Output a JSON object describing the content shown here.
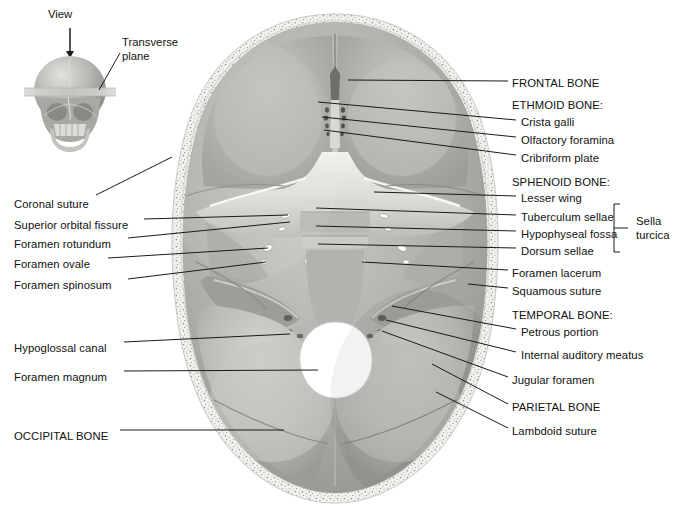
{
  "figure": {
    "background_color": "#ffffff",
    "text_color": "#111111",
    "leader_color": "#1a1a1a",
    "width": 676,
    "height": 518
  },
  "inset": {
    "name": "orientation-inset",
    "view_label": "View",
    "plane_label": "Transverse\nplane",
    "description": "anterior view of skull with horizontal transverse plane band and downward view arrow"
  },
  "labels_right": [
    {
      "id": "frontal-bone",
      "text": "FRONTAL BONE",
      "kind": "bone",
      "x": 512,
      "y": 77,
      "leader": {
        "x1": 508,
        "y1": 81,
        "x2": 348,
        "y2": 80
      }
    },
    {
      "id": "ethmoid-bone",
      "text": "ETHMOID BONE:",
      "kind": "heading",
      "x": 512,
      "y": 99,
      "leader": null
    },
    {
      "id": "crista-galli",
      "text": "Crista galli",
      "kind": "part",
      "x": 521,
      "y": 116,
      "leader": {
        "x1": 516,
        "y1": 120,
        "x2": 318,
        "y2": 102
      }
    },
    {
      "id": "olfactory-foramina",
      "text": "Olfactory foramina",
      "kind": "part",
      "x": 521,
      "y": 134,
      "leader": {
        "x1": 516,
        "y1": 137,
        "x2": 322,
        "y2": 117
      }
    },
    {
      "id": "cribriform-plate",
      "text": "Cribriform plate",
      "kind": "part",
      "x": 521,
      "y": 152,
      "leader": {
        "x1": 516,
        "y1": 155,
        "x2": 324,
        "y2": 130
      }
    },
    {
      "id": "sphenoid-bone",
      "text": "SPHENOID BONE:",
      "kind": "heading",
      "x": 512,
      "y": 176,
      "leader": null
    },
    {
      "id": "lesser-wing",
      "text": "Lesser wing",
      "kind": "part",
      "x": 521,
      "y": 192,
      "leader": {
        "x1": 516,
        "y1": 196,
        "x2": 374,
        "y2": 192
      }
    },
    {
      "id": "tuberculum-sellae",
      "text": "Tuberculum sellae",
      "kind": "part",
      "x": 521,
      "y": 211,
      "leader": {
        "x1": 516,
        "y1": 215,
        "x2": 316,
        "y2": 208
      }
    },
    {
      "id": "hypophyseal-fossa",
      "text": "Hypophyseal fossa",
      "kind": "part",
      "x": 521,
      "y": 228,
      "leader": {
        "x1": 516,
        "y1": 231,
        "x2": 316,
        "y2": 226
      }
    },
    {
      "id": "dorsum-sellae",
      "text": "Dorsum sellae",
      "kind": "part",
      "x": 521,
      "y": 245,
      "leader": {
        "x1": 516,
        "y1": 248,
        "x2": 318,
        "y2": 244
      }
    },
    {
      "id": "foramen-lacerum",
      "text": "Foramen lacerum",
      "kind": "part",
      "x": 512,
      "y": 267,
      "leader": {
        "x1": 508,
        "y1": 270,
        "x2": 362,
        "y2": 262
      }
    },
    {
      "id": "squamous-suture",
      "text": "Squamous suture",
      "kind": "part",
      "x": 512,
      "y": 285,
      "leader": {
        "x1": 508,
        "y1": 288,
        "x2": 468,
        "y2": 284
      }
    },
    {
      "id": "temporal-bone",
      "text": "TEMPORAL BONE:",
      "kind": "heading",
      "x": 512,
      "y": 309,
      "leader": null
    },
    {
      "id": "petrous-portion",
      "text": "Petrous portion",
      "kind": "part",
      "x": 521,
      "y": 326,
      "leader": {
        "x1": 516,
        "y1": 329,
        "x2": 392,
        "y2": 306
      }
    },
    {
      "id": "internal-auditory-meatus",
      "text": "Internal auditory meatus",
      "kind": "part",
      "x": 521,
      "y": 349,
      "leader": {
        "x1": 516,
        "y1": 352,
        "x2": 386,
        "y2": 320
      }
    },
    {
      "id": "jugular-foramen",
      "text": "Jugular foramen",
      "kind": "part",
      "x": 512,
      "y": 374,
      "leader": {
        "x1": 508,
        "y1": 377,
        "x2": 382,
        "y2": 331
      }
    },
    {
      "id": "parietal-bone",
      "text": "PARIETAL BONE",
      "kind": "bone",
      "x": 512,
      "y": 401,
      "leader": {
        "x1": 508,
        "y1": 404,
        "x2": 432,
        "y2": 364
      }
    },
    {
      "id": "lambdoid-suture",
      "text": "Lambdoid suture",
      "kind": "part",
      "x": 512,
      "y": 425,
      "leader": {
        "x1": 508,
        "y1": 428,
        "x2": 436,
        "y2": 392
      }
    }
  ],
  "labels_left": [
    {
      "id": "coronal-suture",
      "text": "Coronal suture",
      "x": 14,
      "y": 198,
      "leader": {
        "x1": 96,
        "y1": 195,
        "x2": 172,
        "y2": 157
      }
    },
    {
      "id": "superior-orbital-fissure",
      "text": "Superior orbital fissure",
      "x": 14,
      "y": 219,
      "leader": {
        "x1": 144,
        "y1": 219,
        "x2": 288,
        "y2": 215
      }
    },
    {
      "id": "foramen-rotundum",
      "text": "Foramen rotundum",
      "x": 14,
      "y": 238,
      "leader": {
        "x1": 128,
        "y1": 238,
        "x2": 290,
        "y2": 222
      }
    },
    {
      "id": "foramen-ovale",
      "text": "Foramen ovale",
      "x": 14,
      "y": 258,
      "leader": {
        "x1": 108,
        "y1": 258,
        "x2": 268,
        "y2": 248
      }
    },
    {
      "id": "foramen-spinosum",
      "text": "Foramen spinosum",
      "x": 14,
      "y": 279,
      "leader": {
        "x1": 128,
        "y1": 279,
        "x2": 266,
        "y2": 262
      }
    },
    {
      "id": "hypoglossal-canal",
      "text": "Hypoglossal canal",
      "x": 14,
      "y": 342,
      "leader": {
        "x1": 124,
        "y1": 342,
        "x2": 290,
        "y2": 334
      }
    },
    {
      "id": "foramen-magnum",
      "text": "Foramen magnum",
      "x": 14,
      "y": 371,
      "leader": {
        "x1": 124,
        "y1": 371,
        "x2": 318,
        "y2": 370
      }
    },
    {
      "id": "occipital-bone",
      "text": "OCCIPITAL BONE",
      "x": 14,
      "y": 430,
      "leader": {
        "x1": 120,
        "y1": 430,
        "x2": 284,
        "y2": 430
      }
    }
  ],
  "bracket": {
    "id": "sella-turcica-bracket",
    "label": "Sella\nturcica",
    "groups": [
      "Tuberculum sellae",
      "Hypophyseal fossa",
      "Dorsum sellae"
    ],
    "x": 628,
    "y": 215,
    "top": 204,
    "bottom": 252,
    "spine_x": 614,
    "tick_x": 622
  },
  "colors": {
    "bone_light": "#e8e7e3",
    "bone_mid": "#b9b8b3",
    "bone_dark": "#8f8e8a",
    "cavity_shadow": "#a3a29d",
    "diploe": "#f2f1ee",
    "foramen_magnum": "#ffffff",
    "inset_skull": "#b5b4af",
    "plane_band": "#cfcecb"
  }
}
